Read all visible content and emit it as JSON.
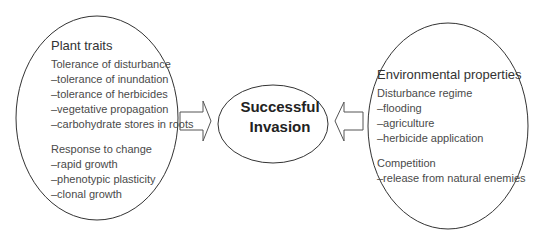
{
  "left_node": {
    "title": "Plant traits",
    "groups": [
      {
        "label": "Tolerance of disturbance",
        "items": [
          "–tolerance of inundation",
          "–tolerance of herbicides",
          "–vegetative propagation",
          "–carbohydrate stores in roots"
        ]
      },
      {
        "label": "Response to change",
        "items": [
          "–rapid growth",
          "–phenotypic plasticity",
          "–clonal growth"
        ]
      }
    ]
  },
  "center_node": {
    "line1": "Successful",
    "line2": "Invasion"
  },
  "right_node": {
    "title": "Environmental properties",
    "groups": [
      {
        "label": "Disturbance regime",
        "items": [
          "–flooding",
          "–agriculture",
          "–herbicide application"
        ]
      },
      {
        "label": "Competition",
        "items": [
          "–release from natural enemies"
        ]
      }
    ]
  },
  "arrows": [
    {
      "from": "left_node",
      "to": "center_node",
      "direction": "right"
    },
    {
      "from": "right_node",
      "to": "center_node",
      "direction": "left"
    }
  ],
  "colors": {
    "stroke": "#333333",
    "text": "#444444",
    "background": "#ffffff"
  }
}
